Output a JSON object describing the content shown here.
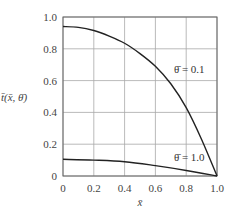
{
  "chart_data": {
    "type": "line",
    "title": "",
    "xlabel": "x̄",
    "ylabel": "t̄(x̄, θ̄)",
    "xlim": [
      0,
      1.0
    ],
    "ylim": [
      0,
      1.0
    ],
    "grid": true,
    "x_ticks": [
      "0",
      "0.2",
      "0.4",
      "0.6",
      "0.8",
      "1.0"
    ],
    "y_ticks": [
      "0",
      "0.2",
      "0.4",
      "0.6",
      "0.8",
      "1.0"
    ],
    "series": [
      {
        "name": "θ̄ = 0.1",
        "x": [
          0,
          0.1,
          0.2,
          0.3,
          0.4,
          0.5,
          0.6,
          0.7,
          0.8,
          0.9,
          1.0
        ],
        "values": [
          0.94,
          0.935,
          0.915,
          0.88,
          0.835,
          0.77,
          0.69,
          0.58,
          0.43,
          0.23,
          0.0
        ]
      },
      {
        "name": "θ̄ = 1.0",
        "x": [
          0,
          0.2,
          0.4,
          0.6,
          0.8,
          1.0
        ],
        "values": [
          0.105,
          0.1,
          0.09,
          0.065,
          0.035,
          0.0
        ]
      }
    ],
    "annotations": [
      {
        "text": "θ̄ = 0.1",
        "x": 0.72,
        "y": 0.67
      },
      {
        "text": "θ̄ = 1.0",
        "x": 0.72,
        "y": 0.12
      }
    ]
  }
}
